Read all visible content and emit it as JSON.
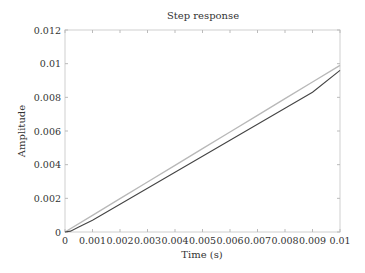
{
  "chart_data": {
    "type": "line",
    "title": "Step response",
    "xlabel": "Time (s)",
    "ylabel": "Amplitude",
    "xlim": [
      0,
      0.01
    ],
    "ylim": [
      0,
      0.012
    ],
    "x_ticks": [
      "0",
      "0.001",
      "0.002",
      "0.003",
      "0.004",
      "0.005",
      "0.006",
      "0.007",
      "0.008",
      "0.009",
      "0.01"
    ],
    "y_ticks": [
      "0",
      "0.002",
      "0.004",
      "0.006",
      "0.008",
      "0.01",
      "0.012"
    ],
    "grid": false,
    "legend": null,
    "series": [
      {
        "name": "response (light)",
        "color": "#b8b8b8",
        "x": [
          0,
          0.001,
          0.002,
          0.003,
          0.004,
          0.005,
          0.006,
          0.007,
          0.008,
          0.009,
          0.01
        ],
        "y": [
          0,
          0.00099,
          0.00198,
          0.00297,
          0.00396,
          0.00495,
          0.00594,
          0.00693,
          0.00792,
          0.00891,
          0.0099
        ]
      },
      {
        "name": "response (dark)",
        "color": "#444444",
        "x": [
          0,
          0.0002,
          0.0005,
          0.001,
          0.002,
          0.003,
          0.004,
          0.005,
          0.006,
          0.007,
          0.008,
          0.009,
          0.01
        ],
        "y": [
          0,
          5e-05,
          0.0003,
          0.0007,
          0.00165,
          0.0026,
          0.00355,
          0.0045,
          0.00545,
          0.0064,
          0.00735,
          0.0083,
          0.0096
        ]
      }
    ]
  }
}
